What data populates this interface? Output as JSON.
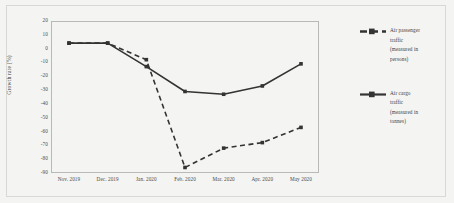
{
  "chart_data": {
    "type": "line",
    "title": "",
    "xlabel": "",
    "ylabel": "Growth rate (%)",
    "categories": [
      "Nov. 2019",
      "Dec. 2019",
      "Jan. 2020",
      "Feb. 2020",
      "Mar. 2020",
      "Apr. 2020",
      "May 2020"
    ],
    "ylim": [
      -90,
      20
    ],
    "yticks": [
      20,
      10,
      0,
      -10,
      -20,
      -30,
      -40,
      -50,
      -60,
      -70,
      -80,
      -90
    ],
    "ytick_labels": [
      "20",
      "10",
      "0",
      "-10",
      "-20",
      "-30",
      "-40",
      "-50",
      "-60",
      "-70",
      "-80",
      "-90"
    ],
    "grid": false,
    "legend_position": "right",
    "series": [
      {
        "name": "air-passenger-traffic",
        "label_lines": [
          "Air passenger",
          "traffic",
          "(measured in",
          "persons)"
        ],
        "style": "dashed",
        "color": "#333333",
        "marker": "square",
        "values": [
          4,
          4,
          -8,
          -86,
          -72,
          -68,
          -57
        ]
      },
      {
        "name": "air-cargo-traffic",
        "label_lines": [
          "Air cargo",
          "traffic",
          "(measured in",
          "tonnes)"
        ],
        "style": "solid",
        "color": "#333333",
        "marker": "square",
        "values": [
          4,
          4,
          -13,
          -31,
          -33,
          -27,
          -11
        ]
      }
    ]
  },
  "legend": {
    "entries": [
      {
        "id": "legend-passenger",
        "line1": "Air passenger",
        "line2": "traffic",
        "line3": "(measured in",
        "line4": "persons)"
      },
      {
        "id": "legend-cargo",
        "line1": "Air cargo",
        "line2": "traffic",
        "line3": "(measured in",
        "line4": "tonnes)"
      }
    ]
  }
}
